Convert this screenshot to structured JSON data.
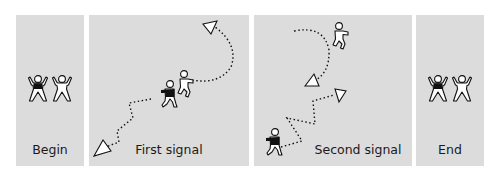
{
  "panels": [
    {
      "id": "begin",
      "label": "Begin"
    },
    {
      "id": "first-signal",
      "label": "First signal"
    },
    {
      "id": "second-signal",
      "label": "Second signal"
    },
    {
      "id": "end",
      "label": "End"
    }
  ],
  "legend": {
    "dark_figure": "player in black shirt",
    "light_figure": "player in white shirt",
    "dotted_path": "movement path",
    "triangle": "direction arrow"
  },
  "colors": {
    "panel_bg": "#dcdcdc",
    "page_bg": "#ffffff",
    "figure_dark": "#111111",
    "figure_light": "#ffffff",
    "outline": "#111111"
  }
}
